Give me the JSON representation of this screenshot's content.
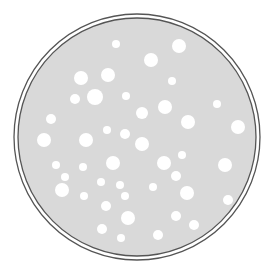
{
  "illustration": {
    "subject": "petri dish with white spots",
    "colors": {
      "background": "#ffffff",
      "plate_fill": "#d9d9d9",
      "rim_stroke": "#555555",
      "gap_fill": "#ffffff",
      "spot_fill": "#ffffff"
    },
    "plate": {
      "cx": 137,
      "cy": 137,
      "outer_r": 123,
      "inner_r": 119
    },
    "spots": [
      {
        "x": 116,
        "y": 44,
        "r": 4
      },
      {
        "x": 179,
        "y": 46,
        "r": 7
      },
      {
        "x": 151,
        "y": 60,
        "r": 7
      },
      {
        "x": 81,
        "y": 78,
        "r": 7
      },
      {
        "x": 108,
        "y": 75,
        "r": 7
      },
      {
        "x": 172,
        "y": 81,
        "r": 4
      },
      {
        "x": 75,
        "y": 99,
        "r": 5
      },
      {
        "x": 95,
        "y": 97,
        "r": 8
      },
      {
        "x": 126,
        "y": 96,
        "r": 4
      },
      {
        "x": 217,
        "y": 104,
        "r": 4
      },
      {
        "x": 142,
        "y": 113,
        "r": 6
      },
      {
        "x": 165,
        "y": 107,
        "r": 7
      },
      {
        "x": 51,
        "y": 119,
        "r": 5
      },
      {
        "x": 107,
        "y": 130,
        "r": 4
      },
      {
        "x": 125,
        "y": 134,
        "r": 5
      },
      {
        "x": 188,
        "y": 122,
        "r": 7
      },
      {
        "x": 238,
        "y": 127,
        "r": 7
      },
      {
        "x": 44,
        "y": 140,
        "r": 7
      },
      {
        "x": 86,
        "y": 140,
        "r": 7
      },
      {
        "x": 142,
        "y": 144,
        "r": 7
      },
      {
        "x": 164,
        "y": 163,
        "r": 7
      },
      {
        "x": 182,
        "y": 155,
        "r": 4
      },
      {
        "x": 56,
        "y": 165,
        "r": 4
      },
      {
        "x": 83,
        "y": 167,
        "r": 4
      },
      {
        "x": 113,
        "y": 163,
        "r": 7
      },
      {
        "x": 65,
        "y": 177,
        "r": 4
      },
      {
        "x": 62,
        "y": 190,
        "r": 7
      },
      {
        "x": 101,
        "y": 182,
        "r": 4
      },
      {
        "x": 120,
        "y": 185,
        "r": 4
      },
      {
        "x": 125,
        "y": 196,
        "r": 4
      },
      {
        "x": 84,
        "y": 196,
        "r": 4
      },
      {
        "x": 176,
        "y": 176,
        "r": 5
      },
      {
        "x": 153,
        "y": 187,
        "r": 4
      },
      {
        "x": 187,
        "y": 193,
        "r": 7
      },
      {
        "x": 225,
        "y": 165,
        "r": 7
      },
      {
        "x": 228,
        "y": 200,
        "r": 5
      },
      {
        "x": 106,
        "y": 206,
        "r": 5
      },
      {
        "x": 128,
        "y": 218,
        "r": 7
      },
      {
        "x": 102,
        "y": 229,
        "r": 5
      },
      {
        "x": 176,
        "y": 216,
        "r": 5
      },
      {
        "x": 194,
        "y": 225,
        "r": 5
      },
      {
        "x": 121,
        "y": 238,
        "r": 4
      },
      {
        "x": 158,
        "y": 235,
        "r": 5
      }
    ]
  }
}
